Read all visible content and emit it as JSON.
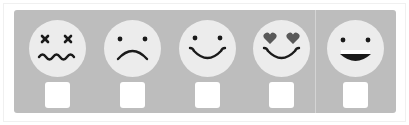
{
  "rating_widget": {
    "colors": {
      "panel_bg": "#bdbdbd",
      "face_bg": "#ececec",
      "feature": "#1a1a1a",
      "heart": "#595959",
      "checkbox_bg": "#ffffff"
    },
    "options": [
      {
        "id": "dizzy",
        "icon": "dizzy-face-icon",
        "checked": false
      },
      {
        "id": "sad",
        "icon": "frowning-face-icon",
        "checked": false
      },
      {
        "id": "happy",
        "icon": "smiling-face-icon",
        "checked": false
      },
      {
        "id": "love",
        "icon": "heart-eyes-face-icon",
        "checked": false
      },
      {
        "id": "grin",
        "icon": "grinning-face-icon",
        "checked": false
      }
    ]
  }
}
